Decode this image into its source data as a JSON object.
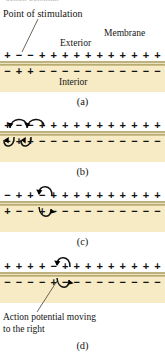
{
  "figure": {
    "top_cropped_text": "action potential",
    "labels": {
      "point_of_stimulation": "Point of stimulation",
      "exterior": "Exterior",
      "membrane": "Membrane",
      "interior": "Interior",
      "action_potential": "Action potential moving",
      "action_potential_line2": "to the right"
    },
    "captions": {
      "a": "(a)",
      "b": "(b)",
      "c": "(c)",
      "d": "(d)"
    },
    "colors": {
      "interior_fill": "#f6ebc4",
      "membrane_band": "#a99b63",
      "membrane_highlight": "#efe8c8",
      "text": "#141414",
      "leader_line": "#5a5348",
      "arrow": "#111111",
      "background": "#ffffff"
    },
    "panels": [
      {
        "id": "a",
        "caption": "(a)",
        "outer_charges": [
          "+",
          "−",
          "−",
          "+",
          "+",
          "+",
          "+",
          "+",
          "+",
          "+",
          "+",
          "+",
          "+",
          "+"
        ],
        "inner_charges": [
          "−",
          "+",
          "+",
          "−",
          "−",
          "−",
          "−",
          "−",
          "−",
          "−",
          "−",
          "−",
          "−",
          "−"
        ],
        "arrows": []
      },
      {
        "id": "b",
        "caption": "(b)",
        "outer_charges": [
          "+",
          "−",
          "−",
          "+",
          "+",
          "+",
          "+",
          "+",
          "+",
          "+",
          "+",
          "+",
          "+",
          "+"
        ],
        "inner_charges": [
          "−",
          "+",
          "+",
          "−",
          "−",
          "−",
          "−",
          "−",
          "−",
          "−",
          "−",
          "−",
          "−",
          "−"
        ],
        "arrows": [
          "outer-arc-1",
          "outer-arc-2",
          "inner-arc-1",
          "inner-arc-2"
        ]
      },
      {
        "id": "c",
        "caption": "(c)",
        "outer_charges": [
          "−",
          "+",
          "+",
          "−",
          "+",
          "+",
          "+",
          "+",
          "+",
          "+",
          "+",
          "+",
          "+",
          "+"
        ],
        "inner_charges": [
          "+",
          "−",
          "−",
          "+",
          "−",
          "−",
          "−",
          "−",
          "−",
          "−",
          "−",
          "−",
          "−",
          "−"
        ],
        "arrows": [
          "outer-arc-1",
          "inner-arc-1"
        ]
      },
      {
        "id": "d",
        "caption": "(d)",
        "outer_charges": [
          "+",
          "+",
          "+",
          "+",
          "−",
          "+",
          "+",
          "+",
          "+",
          "+",
          "+",
          "+",
          "+",
          "+"
        ],
        "inner_charges": [
          "−",
          "−",
          "−",
          "−",
          "+",
          "−",
          "−",
          "−",
          "−",
          "−",
          "−",
          "−",
          "−",
          "−"
        ],
        "arrows": [
          "outer-arc-1",
          "inner-arc-1"
        ]
      }
    ]
  }
}
